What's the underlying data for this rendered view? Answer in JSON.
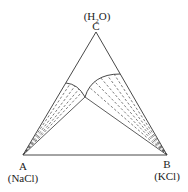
{
  "diagram": {
    "type": "ternary-phase-diagram",
    "vertices": {
      "C": {
        "letter": "C",
        "compound_prefix": "(H",
        "compound_sub": "2",
        "compound_suffix": "O)",
        "x": 96,
        "y": 32
      },
      "A": {
        "letter": "A",
        "compound": "(NaCl)",
        "x": 23,
        "y": 155
      },
      "B": {
        "letter": "B",
        "compound": "(KCl)",
        "x": 167,
        "y": 155
      }
    },
    "invariant_point": {
      "x": 85,
      "y": 97
    },
    "line_color": "#333333"
  }
}
